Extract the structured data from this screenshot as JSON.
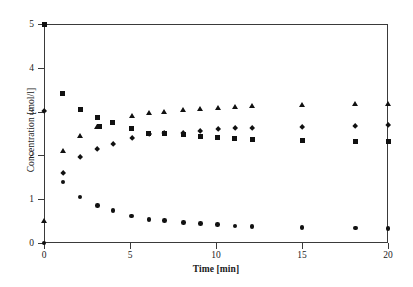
{
  "chart_data": {
    "type": "scatter",
    "title": "",
    "xlabel": "Time [min]",
    "ylabel": "Concentration [mol/l]",
    "xlim": [
      0,
      20
    ],
    "ylim": [
      0,
      5
    ],
    "xticks": [
      0,
      5,
      10,
      15,
      20
    ],
    "yticks": [
      0,
      1,
      2,
      3,
      4,
      5
    ],
    "xtick_labels": [
      "0",
      "5",
      "10",
      "15",
      "20"
    ],
    "ytick_labels": [
      "0",
      "1",
      "2",
      "3",
      "4",
      "5"
    ],
    "grid": false,
    "legend": "none",
    "series": [
      {
        "name": "series-square",
        "marker": "square",
        "color": "#111111",
        "points": [
          {
            "x": 0.0,
            "y": 5.0
          },
          {
            "x": 1.1,
            "y": 3.41
          },
          {
            "x": 2.1,
            "y": 3.05
          },
          {
            "x": 3.1,
            "y": 2.86
          },
          {
            "x": 3.2,
            "y": 2.65
          },
          {
            "x": 4.0,
            "y": 2.74
          },
          {
            "x": 5.1,
            "y": 2.62
          },
          {
            "x": 6.1,
            "y": 2.5
          },
          {
            "x": 7.0,
            "y": 2.5
          },
          {
            "x": 8.1,
            "y": 2.47
          },
          {
            "x": 9.1,
            "y": 2.43
          },
          {
            "x": 10.1,
            "y": 2.4
          },
          {
            "x": 11.1,
            "y": 2.38
          },
          {
            "x": 12.1,
            "y": 2.37
          },
          {
            "x": 15.0,
            "y": 2.34
          },
          {
            "x": 18.1,
            "y": 2.31
          },
          {
            "x": 20.0,
            "y": 2.31
          }
        ]
      },
      {
        "name": "series-triangle",
        "marker": "triangle",
        "color": "#111111",
        "points": [
          {
            "x": 0.0,
            "y": 0.5
          },
          {
            "x": 1.1,
            "y": 2.09
          },
          {
            "x": 2.1,
            "y": 2.43
          },
          {
            "x": 3.1,
            "y": 2.65
          },
          {
            "x": 5.1,
            "y": 2.89
          },
          {
            "x": 6.1,
            "y": 2.96
          },
          {
            "x": 7.0,
            "y": 3.0
          },
          {
            "x": 8.1,
            "y": 3.03
          },
          {
            "x": 9.1,
            "y": 3.06
          },
          {
            "x": 10.1,
            "y": 3.09
          },
          {
            "x": 11.1,
            "y": 3.11
          },
          {
            "x": 12.1,
            "y": 3.12
          },
          {
            "x": 15.0,
            "y": 3.15
          },
          {
            "x": 18.1,
            "y": 3.16
          },
          {
            "x": 20.0,
            "y": 3.17
          }
        ]
      },
      {
        "name": "series-diamond",
        "marker": "diamond",
        "color": "#111111",
        "points": [
          {
            "x": 0.0,
            "y": 3.0
          },
          {
            "x": 1.1,
            "y": 1.6
          },
          {
            "x": 2.1,
            "y": 1.95
          },
          {
            "x": 3.1,
            "y": 2.15
          },
          {
            "x": 4.0,
            "y": 2.26
          },
          {
            "x": 5.1,
            "y": 2.39
          },
          {
            "x": 6.1,
            "y": 2.48
          },
          {
            "x": 7.0,
            "y": 2.51
          },
          {
            "x": 8.1,
            "y": 2.51
          },
          {
            "x": 9.1,
            "y": 2.55
          },
          {
            "x": 10.1,
            "y": 2.59
          },
          {
            "x": 11.1,
            "y": 2.62
          },
          {
            "x": 12.1,
            "y": 2.63
          },
          {
            "x": 15.0,
            "y": 2.65
          },
          {
            "x": 18.1,
            "y": 2.67
          },
          {
            "x": 20.0,
            "y": 2.68
          }
        ]
      },
      {
        "name": "series-circle",
        "marker": "circle",
        "color": "#111111",
        "points": [
          {
            "x": 0.0,
            "y": 0.0
          },
          {
            "x": 1.1,
            "y": 1.39
          },
          {
            "x": 2.1,
            "y": 1.05
          },
          {
            "x": 3.1,
            "y": 0.85
          },
          {
            "x": 4.0,
            "y": 0.74
          },
          {
            "x": 5.1,
            "y": 0.62
          },
          {
            "x": 6.1,
            "y": 0.54
          },
          {
            "x": 7.0,
            "y": 0.51
          },
          {
            "x": 8.1,
            "y": 0.47
          },
          {
            "x": 9.1,
            "y": 0.44
          },
          {
            "x": 10.1,
            "y": 0.42
          },
          {
            "x": 11.1,
            "y": 0.39
          },
          {
            "x": 12.1,
            "y": 0.38
          },
          {
            "x": 15.0,
            "y": 0.35
          },
          {
            "x": 18.1,
            "y": 0.34
          },
          {
            "x": 20.0,
            "y": 0.33
          }
        ]
      }
    ]
  }
}
